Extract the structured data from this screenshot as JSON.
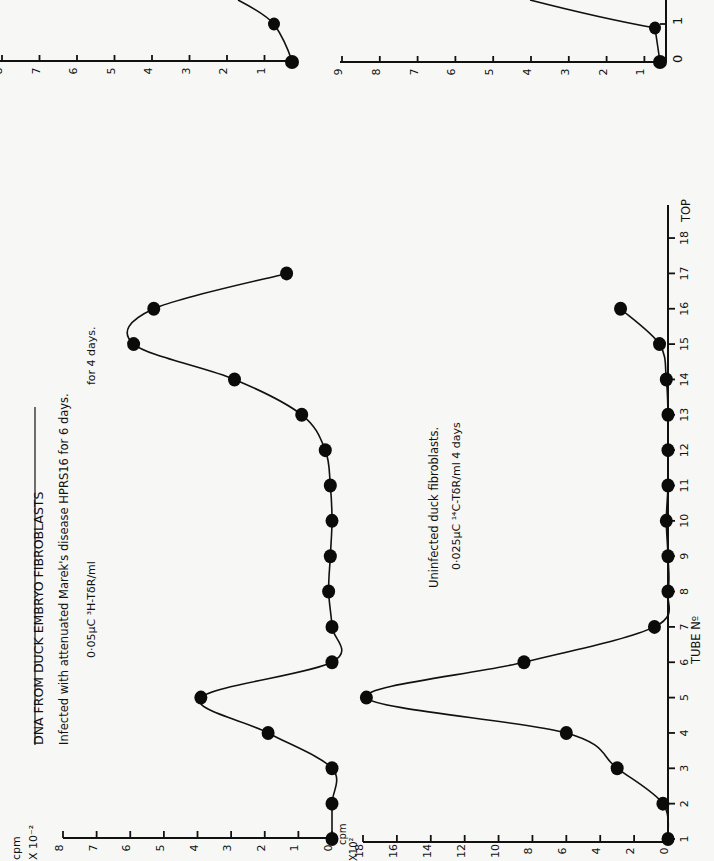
{
  "figure": {
    "title": "DNA FROM DUCK EMBRYO   FIBROBLASTS",
    "infected_caption_line1": "Infected with attenuated Marek's disease HPRS16 for 6 days.",
    "infected_caption_line2a": "0·05μC ³H-TδR/ml",
    "infected_caption_line2b": "for 4 days.",
    "uninfected_caption_line1": "Uninfected duck fibroblasts.",
    "uninfected_caption_line2": "0·025μC ¹⁴C-TδR/ml 4 days",
    "x_axis_label": "TUBE Nº",
    "x_axis_end_label": "TOP",
    "upper_y_label_1": "cpm",
    "upper_y_label_2": "X 10⁻²",
    "lower_y_label_1": "cpm",
    "lower_y_label_2": "X10²",
    "orientation": "rotated 90° counter-clockwise"
  },
  "top_strip": {
    "left_axis_ticks": [
      "8",
      "7",
      "6",
      "5",
      "4",
      "3",
      "2",
      "1"
    ],
    "right_axis_ticks": [
      "9",
      "8",
      "7",
      "6",
      "5",
      "4",
      "3",
      "2",
      "1"
    ],
    "tube_axis_ticks": [
      "0",
      "1"
    ]
  },
  "chart_data": [
    {
      "type": "line",
      "title": "DNA FROM DUCK EMBRYO FIBROBLASTS — Infected with attenuated Marek's disease HPRS16 (³H-TdR)",
      "xlabel": "TUBE Nº",
      "ylabel": "cpm X 10⁻²",
      "x": [
        1,
        2,
        3,
        4,
        5,
        6,
        7,
        8,
        9,
        10,
        11,
        12,
        13,
        14,
        15,
        16,
        17
      ],
      "values": [
        0,
        0,
        0,
        1.9,
        3.9,
        0,
        0,
        0.1,
        0.05,
        0,
        0.05,
        0.2,
        0.9,
        2.9,
        5.9,
        5.3,
        1.35
      ],
      "x_ticks": [
        "1",
        "2",
        "3",
        "4",
        "5",
        "6",
        "7",
        "8",
        "9",
        "10",
        "11",
        "12",
        "13",
        "14",
        "15",
        "16",
        "17",
        "18",
        "TOP"
      ],
      "y_ticks": [
        "0",
        "1",
        "2",
        "3",
        "4",
        "5",
        "6",
        "7",
        "8"
      ],
      "ylim": [
        0,
        8
      ],
      "xlim": [
        1,
        18
      ],
      "grid": false,
      "markers": "filled circles"
    },
    {
      "type": "line",
      "title": "Uninfected duck fibroblasts (¹⁴C-TdR)",
      "xlabel": "TUBE Nº",
      "ylabel": "cpm X10²",
      "x": [
        1,
        2,
        3,
        4,
        5,
        6,
        7,
        8,
        9,
        10,
        11,
        12,
        13,
        14,
        15,
        16
      ],
      "values": [
        0,
        0.3,
        3,
        6,
        17.8,
        8.5,
        0.8,
        0,
        0,
        0.1,
        0,
        0,
        0,
        0.1,
        0.5,
        2.8
      ],
      "x_ticks": [
        "1",
        "2",
        "3",
        "4",
        "5",
        "6",
        "7",
        "8",
        "9",
        "10",
        "11",
        "12",
        "13",
        "14",
        "15",
        "16",
        "17",
        "18",
        "TOP"
      ],
      "y_ticks": [
        "0",
        "2",
        "4",
        "6",
        "8",
        "10",
        "12",
        "14",
        "16",
        "18"
      ],
      "ylim": [
        0,
        18
      ],
      "xlim": [
        1,
        18
      ],
      "grid": false,
      "markers": "filled circles"
    }
  ]
}
